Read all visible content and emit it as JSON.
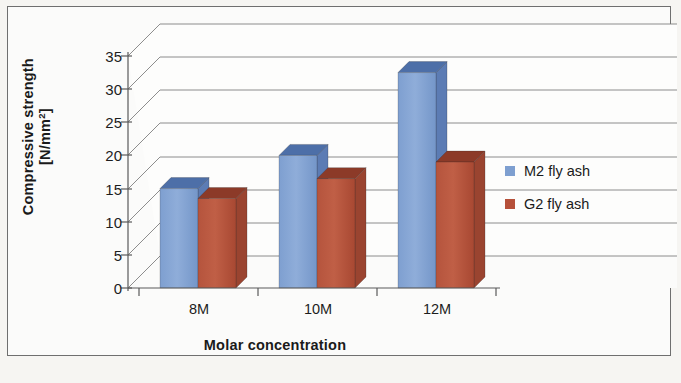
{
  "chart_data": {
    "type": "bar",
    "title": "",
    "subtitle": "",
    "xlabel": "Molar concentration",
    "ylabel": "Compressive strength [N/mm2]",
    "ylabel_line1": "Compressive strength",
    "ylabel_line2": "[N/mm",
    "ylabel_exponent": "2",
    "ylabel_line2_close": "]",
    "categories": [
      "8M",
      "10M",
      "12M"
    ],
    "series": [
      {
        "name": "M2 fly ash",
        "color": "#7e9fd0",
        "values": [
          15,
          20,
          32.5
        ]
      },
      {
        "name": "G2 fly ash",
        "color": "#b6503a",
        "values": [
          13.5,
          16.5,
          19
        ]
      }
    ],
    "ylim": [
      0,
      35
    ],
    "ytick_values": [
      "0",
      "5",
      "10",
      "15",
      "20",
      "25",
      "30",
      "35"
    ],
    "ytick_step": 5,
    "grid": true,
    "grid_orientation": "horizontal",
    "legend_position": "right",
    "style": "3d-clustered-column"
  },
  "colors": {
    "series_blue": "#7e9fd0",
    "series_blue_top": "#4d6fa8",
    "series_blue_side": "#5c7cb4",
    "series_red": "#b6503a",
    "series_red_top": "#8c3a28",
    "series_red_side": "#9a4430",
    "grid_line": "#7a7a7a",
    "axis_line": "#5a5a5a",
    "frame_border": "#6f6f6f",
    "page_background": "#f6f5f2",
    "plot_background": "#fdfdfc",
    "text": "#1a1a1a"
  }
}
